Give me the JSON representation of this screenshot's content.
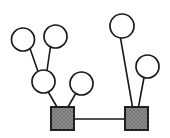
{
  "diagram": {
    "type": "node-link-graph",
    "canvas": {
      "width": 170,
      "height": 138,
      "background": "#ffffff"
    },
    "styles": {
      "edge_color": "#1a1a1a",
      "edge_width": 1.6,
      "circle_fill": "#ffffff",
      "circle_stroke": "#1a1a1a",
      "circle_stroke_width": 1.7,
      "square_fill": "#8c8c8c",
      "square_stroke": "#1a1a1a",
      "square_stroke_width": 1.9,
      "square_pattern": "cross-hatch"
    },
    "nodes": [
      {
        "id": "c1",
        "shape": "circle",
        "label": "",
        "cx": 23.0,
        "cy": 39.5,
        "r": 11.5
      },
      {
        "id": "c2",
        "shape": "circle",
        "label": "",
        "cx": 55.5,
        "cy": 36.5,
        "r": 11.5
      },
      {
        "id": "c3",
        "shape": "circle",
        "label": "",
        "cx": 43.5,
        "cy": 81.5,
        "r": 11.5
      },
      {
        "id": "c4",
        "shape": "circle",
        "label": "",
        "cx": 81.5,
        "cy": 83.5,
        "r": 11.5
      },
      {
        "id": "c5",
        "shape": "circle",
        "label": "",
        "cx": 122.0,
        "cy": 26.0,
        "r": 12.0
      },
      {
        "id": "c6",
        "shape": "circle",
        "label": "",
        "cx": 147.5,
        "cy": 66.5,
        "r": 11.5
      },
      {
        "id": "s1",
        "shape": "square",
        "label": "",
        "x": 51.0,
        "y": 107.0,
        "w": 23.0,
        "h": 23.0
      },
      {
        "id": "s2",
        "shape": "square",
        "label": "",
        "x": 125.0,
        "y": 107.0,
        "w": 23.0,
        "h": 23.0
      }
    ],
    "edges": [
      {
        "id": "e1",
        "from": "c1",
        "to": "c3",
        "x1": 30.0,
        "y1": 48.5,
        "x2": 38.0,
        "y2": 71.5
      },
      {
        "id": "e2",
        "from": "c2",
        "to": "c3",
        "x1": 50.5,
        "y1": 46.5,
        "x2": 47.0,
        "y2": 70.5
      },
      {
        "id": "e3",
        "from": "c3",
        "to": "s1",
        "x1": 48.0,
        "y1": 91.5,
        "x2": 57.0,
        "y2": 107.0
      },
      {
        "id": "e4",
        "from": "c4",
        "to": "s1",
        "x1": 76.0,
        "y1": 93.0,
        "x2": 68.0,
        "y2": 107.0
      },
      {
        "id": "e5",
        "from": "c5",
        "to": "s2",
        "x1": 120.5,
        "y1": 38.0,
        "x2": 132.5,
        "y2": 107.0
      },
      {
        "id": "e6",
        "from": "c6",
        "to": "s2",
        "x1": 144.0,
        "y1": 77.5,
        "x2": 138.5,
        "y2": 107.0
      },
      {
        "id": "e7",
        "from": "s1",
        "to": "s2",
        "x1": 74.0,
        "y1": 119.0,
        "x2": 125.0,
        "y2": 119.0
      }
    ]
  }
}
